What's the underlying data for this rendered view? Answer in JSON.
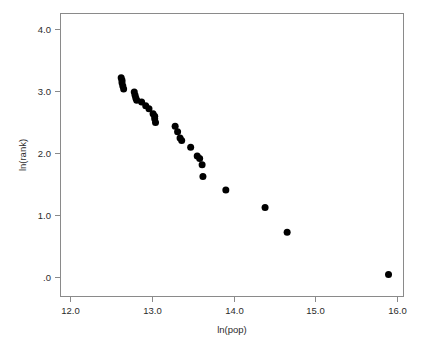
{
  "chart_data": {
    "type": "scatter",
    "title": "",
    "xlabel": "ln(pop)",
    "ylabel": "ln(rank)",
    "xlim": [
      11.65,
      16.1
    ],
    "ylim": [
      -0.27,
      4.22
    ],
    "grid": false,
    "legend": null,
    "marker": {
      "shape": "circle",
      "color": "#000000",
      "size_px": 4.6
    },
    "xticks": [
      12.0,
      13.0,
      14.0,
      15.0,
      16.0
    ],
    "xticklabels": [
      "12.0",
      "13.0",
      "14.0",
      "15.0",
      "16.0"
    ],
    "yticks": [
      0.0,
      1.0,
      2.0,
      3.0,
      4.0
    ],
    "yticklabels": [
      ".0",
      "1.0",
      "2.0",
      "3.0",
      "4.0"
    ],
    "n_points": 30,
    "points": [
      {
        "x": 12.62,
        "y": 3.22
      },
      {
        "x": 12.63,
        "y": 3.18
      },
      {
        "x": 12.63,
        "y": 3.14
      },
      {
        "x": 12.64,
        "y": 3.09
      },
      {
        "x": 12.65,
        "y": 3.04
      },
      {
        "x": 12.78,
        "y": 2.99
      },
      {
        "x": 12.79,
        "y": 2.94
      },
      {
        "x": 12.8,
        "y": 2.89
      },
      {
        "x": 12.81,
        "y": 2.86
      },
      {
        "x": 12.87,
        "y": 2.83
      },
      {
        "x": 12.92,
        "y": 2.77
      },
      {
        "x": 12.96,
        "y": 2.72
      },
      {
        "x": 13.01,
        "y": 2.64
      },
      {
        "x": 13.03,
        "y": 2.6
      },
      {
        "x": 13.03,
        "y": 2.56
      },
      {
        "x": 13.04,
        "y": 2.5
      },
      {
        "x": 13.28,
        "y": 2.44
      },
      {
        "x": 13.31,
        "y": 2.35
      },
      {
        "x": 13.34,
        "y": 2.25
      },
      {
        "x": 13.36,
        "y": 2.21
      },
      {
        "x": 13.47,
        "y": 2.1
      },
      {
        "x": 13.55,
        "y": 1.96
      },
      {
        "x": 13.58,
        "y": 1.92
      },
      {
        "x": 13.61,
        "y": 1.82
      },
      {
        "x": 13.62,
        "y": 1.63
      },
      {
        "x": 13.9,
        "y": 1.41
      },
      {
        "x": 14.38,
        "y": 1.13
      },
      {
        "x": 14.65,
        "y": 0.73
      },
      {
        "x": 15.89,
        "y": 0.05
      }
    ]
  },
  "axes": {
    "x_title": "ln(pop)",
    "y_title": "ln(rank)",
    "x_tick_labels": [
      "12.0",
      "13.0",
      "14.0",
      "15.0",
      "16.0"
    ],
    "y_tick_labels": [
      "4.0",
      "3.0",
      "2.0",
      "1.0",
      ".0"
    ]
  },
  "style": {
    "frame_color": "#8a8a8a",
    "point_color": "#000000",
    "text_color": "#2b2b2b",
    "background": "#ffffff"
  }
}
